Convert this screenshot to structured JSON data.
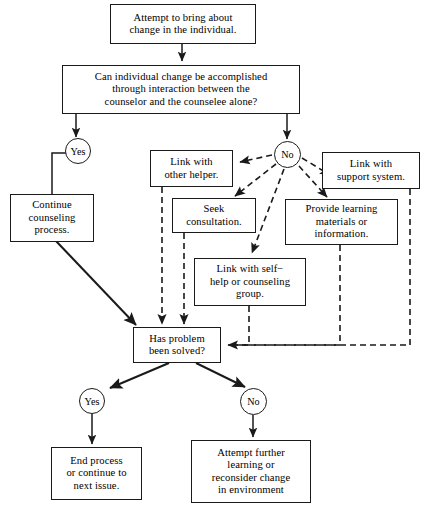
{
  "diagram": {
    "line_color": "#1a1a1a",
    "background": "#ffffff",
    "nodes": [
      {
        "id": "start",
        "kind": "process",
        "label": "Attempt to bring about change in the individual.",
        "lines": [
          "Attempt to bring about",
          "change in the individual."
        ]
      },
      {
        "id": "question1",
        "kind": "decision",
        "label": "Can individual change be accomplished through interaction between the counselor and the counselee alone?",
        "lines": [
          "Can individual change be accomplished",
          "through interaction between the",
          "counselor and the counselee alone?"
        ]
      },
      {
        "id": "yes1",
        "kind": "connector",
        "label": "Yes"
      },
      {
        "id": "no1",
        "kind": "connector",
        "label": "No"
      },
      {
        "id": "continue",
        "kind": "process",
        "label": "Continue counseling process.",
        "lines": [
          "Continue",
          "counseling",
          "process."
        ]
      },
      {
        "id": "other-helper",
        "kind": "process",
        "label": "Link with other helper.",
        "lines": [
          "Link with",
          "other helper."
        ]
      },
      {
        "id": "consultation",
        "kind": "process",
        "label": "Seek consultation.",
        "lines": [
          "Seek",
          "consultation."
        ]
      },
      {
        "id": "support",
        "kind": "process",
        "label": "Link with support system.",
        "lines": [
          "Link with",
          "support system."
        ]
      },
      {
        "id": "materials",
        "kind": "process",
        "label": "Provide learning materials or information.",
        "lines": [
          "Provide learning",
          "materials or",
          "information."
        ]
      },
      {
        "id": "selfhelp",
        "kind": "process",
        "label": "Link with self−help or counseling group.",
        "lines": [
          "Link with self−",
          "help or counseling",
          "group."
        ]
      },
      {
        "id": "question2",
        "kind": "decision",
        "label": "Has problem been solved?",
        "lines": [
          "Has problem",
          "been solved?"
        ]
      },
      {
        "id": "yes2",
        "kind": "connector",
        "label": "Yes"
      },
      {
        "id": "no2",
        "kind": "connector",
        "label": "No"
      },
      {
        "id": "end",
        "kind": "process",
        "label": "End process or continue to next issue.",
        "lines": [
          "End process",
          "or continue to",
          "next issue."
        ]
      },
      {
        "id": "further",
        "kind": "process",
        "label": "Attempt further learning or reconsider change in environment",
        "lines": [
          "Attempt further",
          "learning or",
          "reconsider change",
          "in environment"
        ]
      }
    ],
    "edges": [
      {
        "from": "start",
        "to": "question1",
        "style": "solid"
      },
      {
        "from": "question1",
        "to": "yes1",
        "style": "solid"
      },
      {
        "from": "question1",
        "to": "no1",
        "style": "solid"
      },
      {
        "from": "yes1",
        "to": "continue",
        "style": "solid"
      },
      {
        "from": "no1",
        "to": "other-helper",
        "style": "dashed"
      },
      {
        "from": "no1",
        "to": "consultation",
        "style": "dashed"
      },
      {
        "from": "no1",
        "to": "selfhelp",
        "style": "dashed"
      },
      {
        "from": "no1",
        "to": "materials",
        "style": "dashed"
      },
      {
        "from": "no1",
        "to": "support",
        "style": "dashed"
      },
      {
        "from": "continue",
        "to": "question2",
        "style": "solid"
      },
      {
        "from": "other-helper",
        "to": "question2",
        "style": "dashed"
      },
      {
        "from": "consultation",
        "to": "question2",
        "style": "dashed"
      },
      {
        "from": "selfhelp",
        "to": "question2",
        "style": "dashed"
      },
      {
        "from": "materials",
        "to": "question2",
        "style": "dashed"
      },
      {
        "from": "support",
        "to": "question2",
        "style": "dashed"
      },
      {
        "from": "question2",
        "to": "yes2",
        "style": "solid"
      },
      {
        "from": "question2",
        "to": "no2",
        "style": "solid"
      },
      {
        "from": "yes2",
        "to": "end",
        "style": "solid"
      },
      {
        "from": "no2",
        "to": "further",
        "style": "solid"
      }
    ]
  }
}
